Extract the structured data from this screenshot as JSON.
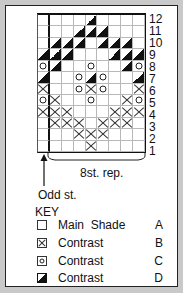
{
  "chart": {
    "columns": 9,
    "rows_count": 12,
    "row_numbers": [
      "12",
      "11",
      "10",
      "9",
      "8",
      "7",
      "6",
      "5",
      "4",
      "3",
      "2",
      "1"
    ],
    "grid_top_to_bottom": [
      [
        ".",
        ".",
        ".",
        ".",
        "D",
        ".",
        ".",
        ".",
        "."
      ],
      [
        ".",
        ".",
        ".",
        "D",
        "D",
        "D",
        ".",
        ".",
        "."
      ],
      [
        ".",
        "D",
        "D",
        "D",
        ".",
        "D",
        "D",
        "D",
        "."
      ],
      [
        "D",
        "D",
        "D",
        ".",
        ".",
        ".",
        "D",
        "D",
        "D"
      ],
      [
        "O",
        "D",
        ".",
        ".",
        "O",
        ".",
        ".",
        "D",
        "O"
      ],
      [
        "D",
        ".",
        ".",
        "O",
        "D",
        "O",
        ".",
        ".",
        "D"
      ],
      [
        "X",
        ".",
        ".",
        "O",
        "X",
        "O",
        ".",
        ".",
        "X"
      ],
      [
        "O",
        "X",
        ".",
        ".",
        "O",
        ".",
        ".",
        "X",
        "O"
      ],
      [
        "X",
        "X",
        "X",
        ".",
        ".",
        ".",
        "X",
        "X",
        "X"
      ],
      [
        ".",
        "X",
        "X",
        "X",
        ".",
        "X",
        "X",
        "X",
        "."
      ],
      [
        ".",
        ".",
        ".",
        "X",
        "X",
        "X",
        ".",
        ".",
        "."
      ],
      [
        ".",
        ".",
        ".",
        ".",
        "X",
        ".",
        ".",
        ".",
        "."
      ]
    ],
    "repeat_label": "8st. rep.",
    "odd_st_label": "Odd st."
  },
  "key": {
    "title": "KEY",
    "items": [
      {
        "symbol": "blank",
        "label": "Main  Shade",
        "letter": "A"
      },
      {
        "symbol": "X",
        "label": "Contrast",
        "letter": "B"
      },
      {
        "symbol": "O",
        "label": "Contrast",
        "letter": "C"
      },
      {
        "symbol": "D",
        "label": "Contrast",
        "letter": "D"
      }
    ]
  }
}
